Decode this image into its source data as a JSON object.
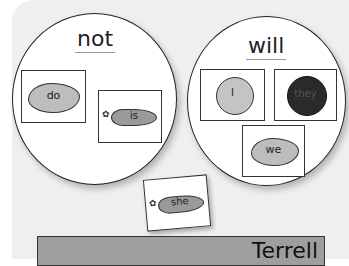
{
  "circles": [
    {
      "heading": "not",
      "cards": [
        {
          "word": "do",
          "picture": "cloud-blob"
        },
        {
          "word": "is",
          "picture": "carrot"
        }
      ]
    },
    {
      "heading": "will",
      "cards": [
        {
          "word": "I",
          "picture": "clock"
        },
        {
          "word": "they",
          "picture": "dark-flower"
        },
        {
          "word": "we",
          "picture": "cloud-blob"
        }
      ]
    }
  ],
  "loose_card": {
    "word": "she",
    "picture": "carrot"
  },
  "nameplate": {
    "name": "Terrell"
  },
  "colors": {
    "board": "#efefef",
    "card_fill": "#ffffff",
    "blob": "#bdbdbd",
    "carrot": "#9a9a9a",
    "flower": "#2a2a2a",
    "nameplate": "#9e9e9e"
  }
}
